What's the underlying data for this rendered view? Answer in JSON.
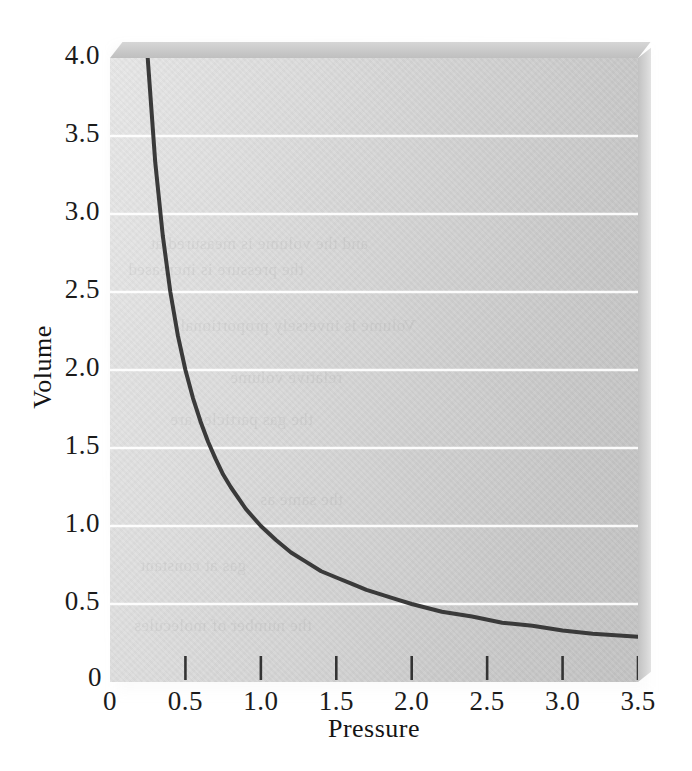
{
  "chart_data": {
    "type": "line",
    "title": "",
    "subtitle": "",
    "xlabel": "Pressure",
    "ylabel": "Volume",
    "xlim": [
      0,
      3.5
    ],
    "ylim": [
      0,
      4.0
    ],
    "grid": true,
    "grid_axis": "y",
    "legend": "none",
    "relationship": "V = 1 / P",
    "x_ticks": [
      0,
      0.5,
      1.0,
      1.5,
      2.0,
      2.5,
      3.0,
      3.5
    ],
    "x_tick_labels": [
      "0",
      "0.5",
      "1.0",
      "1.5",
      "2.0",
      "2.5",
      "3.0",
      "3.5"
    ],
    "y_ticks": [
      0,
      0.5,
      1.0,
      1.5,
      2.0,
      2.5,
      3.0,
      3.5,
      4.0
    ],
    "y_tick_labels": [
      "0",
      "0.5",
      "1.0",
      "1.5",
      "2.0",
      "2.5",
      "3.0",
      "3.5",
      "4.0"
    ],
    "gridline_values": [
      0.5,
      1.0,
      1.5,
      2.0,
      2.5,
      3.0,
      3.5
    ],
    "series": [
      {
        "name": "Boyle's law curve",
        "color": "#3a3a3a",
        "line_width": 4,
        "x": [
          0.25,
          0.3,
          0.35,
          0.4,
          0.45,
          0.5,
          0.55,
          0.6,
          0.65,
          0.7,
          0.75,
          0.8,
          0.9,
          1.0,
          1.1,
          1.2,
          1.3,
          1.4,
          1.5,
          1.6,
          1.7,
          1.8,
          1.9,
          2.0,
          2.2,
          2.4,
          2.6,
          2.8,
          3.0,
          3.2,
          3.5
        ],
        "y": [
          4.0,
          3.33,
          2.86,
          2.5,
          2.22,
          2.0,
          1.82,
          1.67,
          1.54,
          1.43,
          1.33,
          1.25,
          1.11,
          1.0,
          0.91,
          0.83,
          0.77,
          0.71,
          0.67,
          0.63,
          0.59,
          0.56,
          0.53,
          0.5,
          0.45,
          0.42,
          0.38,
          0.36,
          0.33,
          0.31,
          0.29
        ]
      }
    ],
    "colors": {
      "curve": "#3a3a3a",
      "gridline": "#ffffff",
      "panel_light": "#e7e7e7",
      "panel_dark": "#c3c3c3",
      "text": "#1b1b1b"
    }
  },
  "axis": {
    "y_label": "Volume",
    "x_label": "Pressure",
    "origin_y_label": "0",
    "origin_x_label": "0"
  },
  "ghost": {
    "lines": [
      "and the volume is measured at",
      "the pressure is increased",
      "Volume is inversely proportional",
      "relative volume",
      "the gas particles are",
      "the same as",
      "gas at constant",
      "the number of molecules"
    ]
  }
}
